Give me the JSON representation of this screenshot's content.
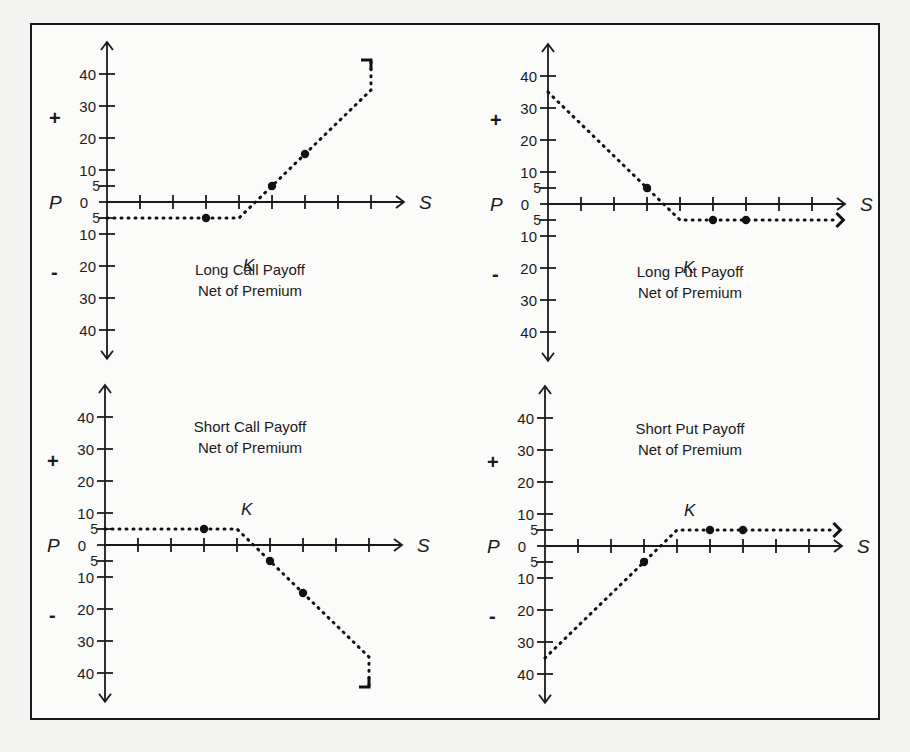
{
  "chart_data": [
    {
      "type": "line",
      "id": "long-call",
      "title": "Long Call Payoff",
      "subtitle": "Net of Premium",
      "xlabel": "S",
      "ylabel": "P",
      "positive_sign": "+",
      "negative_sign": "-",
      "strike_label": "K",
      "y_ticks": [
        40,
        30,
        20,
        10,
        5,
        0,
        -5,
        -10,
        -20,
        -30,
        -40
      ],
      "y_tick_labels": [
        "40",
        "30",
        "20",
        "10",
        "5",
        "0",
        "5",
        "10",
        "20",
        "30",
        "40"
      ],
      "x_tick_count": 8,
      "ylim": [
        -45,
        45
      ],
      "grid": false,
      "series": [
        {
          "name": "payoff",
          "points": [
            [
              0,
              -5
            ],
            [
              4,
              -5
            ],
            [
              4.5,
              0
            ],
            [
              5,
              5
            ],
            [
              6,
              15
            ],
            [
              8,
              35
            ],
            [
              8,
              45
            ]
          ]
        }
      ],
      "markers": [
        [
          3,
          -5
        ],
        [
          5,
          5
        ],
        [
          6,
          15
        ]
      ],
      "end_marker": "up-right-arrow"
    },
    {
      "type": "line",
      "id": "long-put",
      "title": "Long Put Payoff",
      "subtitle": "Net of Premium",
      "xlabel": "S",
      "ylabel": "P",
      "positive_sign": "+",
      "negative_sign": "-",
      "strike_label": "K",
      "y_ticks": [
        40,
        30,
        20,
        10,
        5,
        0,
        -5,
        -10,
        -20,
        -30,
        -40
      ],
      "y_tick_labels": [
        "40",
        "30",
        "20",
        "10",
        "5",
        "0",
        "5",
        "10",
        "20",
        "30",
        "40"
      ],
      "x_tick_count": 8,
      "ylim": [
        -45,
        45
      ],
      "grid": false,
      "series": [
        {
          "name": "payoff",
          "points": [
            [
              0,
              35
            ],
            [
              3,
              5
            ],
            [
              3.5,
              0
            ],
            [
              4,
              -5
            ],
            [
              8.8,
              -5
            ]
          ]
        }
      ],
      "markers": [
        [
          3,
          5
        ],
        [
          5,
          -5
        ],
        [
          6,
          -5
        ]
      ],
      "end_marker": "right-arrow"
    },
    {
      "type": "line",
      "id": "short-call",
      "title": "Short Call Payoff",
      "subtitle": "Net of Premium",
      "xlabel": "S",
      "ylabel": "P",
      "positive_sign": "+",
      "negative_sign": "-",
      "strike_label": "K",
      "y_ticks": [
        40,
        30,
        20,
        10,
        5,
        0,
        -5,
        -10,
        -20,
        -30,
        -40
      ],
      "y_tick_labels": [
        "40",
        "30",
        "20",
        "10",
        "5",
        "0",
        "5",
        "10",
        "20",
        "30",
        "40"
      ],
      "x_tick_count": 8,
      "ylim": [
        -45,
        45
      ],
      "grid": false,
      "series": [
        {
          "name": "payoff",
          "points": [
            [
              0,
              5
            ],
            [
              4,
              5
            ],
            [
              4.5,
              0
            ],
            [
              5,
              -5
            ],
            [
              6,
              -15
            ],
            [
              8,
              -35
            ],
            [
              8,
              -45
            ]
          ]
        }
      ],
      "markers": [
        [
          3,
          5
        ],
        [
          5,
          -5
        ],
        [
          6,
          -15
        ]
      ],
      "end_marker": "down-right-arrow"
    },
    {
      "type": "line",
      "id": "short-put",
      "title": "Short Put Payoff",
      "subtitle": "Net of Premium",
      "xlabel": "S",
      "ylabel": "P",
      "positive_sign": "+",
      "negative_sign": "-",
      "strike_label": "K",
      "y_ticks": [
        40,
        30,
        20,
        10,
        5,
        0,
        -5,
        -10,
        -20,
        -30,
        -40
      ],
      "y_tick_labels": [
        "40",
        "30",
        "20",
        "10",
        "5",
        "0",
        "5",
        "10",
        "20",
        "30",
        "40"
      ],
      "x_tick_count": 8,
      "ylim": [
        -45,
        45
      ],
      "grid": false,
      "series": [
        {
          "name": "payoff",
          "points": [
            [
              0,
              -35
            ],
            [
              3,
              -5
            ],
            [
              3.5,
              0
            ],
            [
              4,
              5
            ],
            [
              8.8,
              5
            ]
          ]
        }
      ],
      "markers": [
        [
          3,
          -5
        ],
        [
          5,
          5
        ],
        [
          6,
          5
        ]
      ],
      "end_marker": "right-arrow"
    }
  ],
  "layout": {
    "panels": [
      {
        "origin_x": 75,
        "origin_y": 177,
        "title_x": 218,
        "title_y": 250,
        "k_x": 211,
        "k_y": 246
      },
      {
        "origin_x": 516,
        "origin_y": 179,
        "title_x": 658,
        "title_y": 252,
        "k_x": 651,
        "k_y": 248
      },
      {
        "origin_x": 73,
        "origin_y": 520,
        "title_x": 218,
        "title_y": 407,
        "k_x": 209,
        "k_y": 490
      },
      {
        "origin_x": 513,
        "origin_y": 521,
        "title_x": 658,
        "title_y": 409,
        "k_x": 652,
        "k_y": 491
      }
    ],
    "x_step": 33,
    "y_unit": 3.2
  }
}
